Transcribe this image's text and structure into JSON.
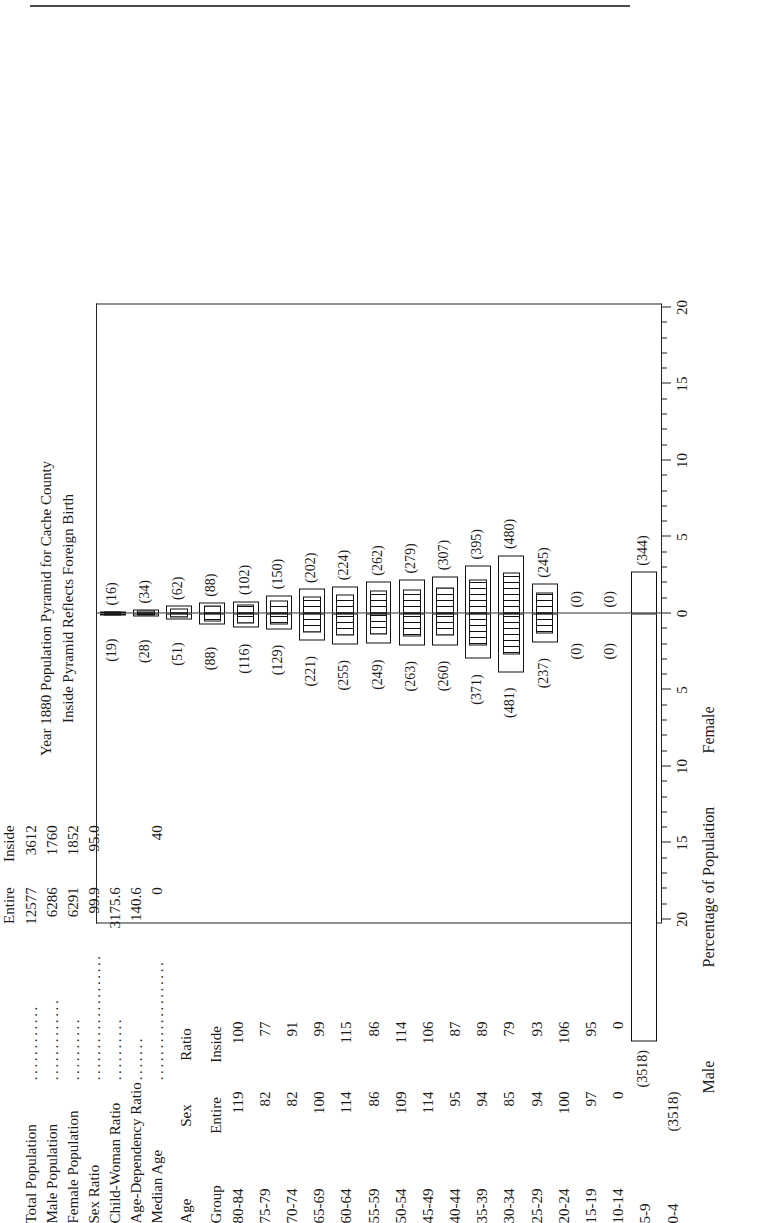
{
  "title": {
    "line1": "Year 1880 Population Pyramid for Cache County",
    "line2": "Inside Pyramid Reflects Foreign Birth"
  },
  "stats": {
    "col_headers": [
      "Entire",
      "Inside"
    ],
    "rows": [
      {
        "label": "Total Population",
        "entire": "12577",
        "inside": "3612"
      },
      {
        "label": "Male Population",
        "entire": "6286",
        "inside": "1760"
      },
      {
        "label": "Female Population",
        "entire": "6291",
        "inside": "1852"
      },
      {
        "label": "Sex Ratio",
        "entire": "99.9",
        "inside": "95.0"
      },
      {
        "label": "Child-Woman Ratio",
        "entire": "3175.6",
        "inside": ""
      },
      {
        "label": "Age-Dependency Ratio",
        "entire": "140.6",
        "inside": ""
      },
      {
        "label": "Median Age",
        "entire": "0",
        "inside": "40"
      }
    ]
  },
  "age_table": {
    "header_age": "Age",
    "header_group": "Group",
    "header_sex": "Sex",
    "header_ratio": "Ratio",
    "header_entire": "Entire",
    "header_inside": "Inside",
    "rows": [
      {
        "age": "80-84",
        "entire": "119",
        "inside": "100"
      },
      {
        "age": "75-79",
        "entire": "82",
        "inside": "77"
      },
      {
        "age": "70-74",
        "entire": "82",
        "inside": "91"
      },
      {
        "age": "65-69",
        "entire": "100",
        "inside": "99"
      },
      {
        "age": "60-64",
        "entire": "114",
        "inside": "115"
      },
      {
        "age": "55-59",
        "entire": "86",
        "inside": "86"
      },
      {
        "age": "50-54",
        "entire": "109",
        "inside": "114"
      },
      {
        "age": "45-49",
        "entire": "114",
        "inside": "106"
      },
      {
        "age": "40-44",
        "entire": "95",
        "inside": "87"
      },
      {
        "age": "35-39",
        "entire": "94",
        "inside": "89"
      },
      {
        "age": "30-34",
        "entire": "85",
        "inside": "79"
      },
      {
        "age": "25-29",
        "entire": "94",
        "inside": "93"
      },
      {
        "age": "20-24",
        "entire": "100",
        "inside": "106"
      },
      {
        "age": "15-19",
        "entire": "97",
        "inside": "95"
      },
      {
        "age": "10-14",
        "entire": "0",
        "inside": "0"
      },
      {
        "age": "5-9",
        "entire": "",
        "inside": ""
      },
      {
        "age": "0-4",
        "entire": "(3518)",
        "inside": ""
      }
    ]
  },
  "axis": {
    "xlabel": "Percentage of Population",
    "male_label": "Male",
    "female_label": "Female",
    "ticks": [
      "20",
      "15",
      "10",
      "5",
      "0",
      "5",
      "10",
      "15",
      "20"
    ],
    "xlim": [
      -20,
      20
    ]
  },
  "chart_data": {
    "type": "bar",
    "title": "Year 1880 Population Pyramid for Cache County",
    "subtitle": "Inside Pyramid Reflects Foreign Birth",
    "xlabel": "Percentage of Population",
    "ylabel": "Age Group",
    "xlim": [
      -20,
      20
    ],
    "grid": false,
    "legend": [
      "Male",
      "Female"
    ],
    "legend_position": "below-axis",
    "categories": [
      "80-84",
      "75-79",
      "70-74",
      "65-69",
      "60-64",
      "55-59",
      "50-54",
      "45-49",
      "40-44",
      "35-39",
      "30-34",
      "25-29",
      "20-24",
      "15-19",
      "10-14",
      "5-9",
      "0-4"
    ],
    "series": [
      {
        "name": "Male (Entire) counts",
        "values": [
          19,
          28,
          51,
          88,
          116,
          129,
          221,
          255,
          249,
          263,
          260,
          371,
          481,
          237,
          0,
          0,
          3518
        ]
      },
      {
        "name": "Female (Entire) counts",
        "values": [
          16,
          34,
          62,
          88,
          102,
          150,
          202,
          224,
          262,
          279,
          307,
          395,
          480,
          245,
          0,
          0,
          344
        ]
      },
      {
        "name": "Male (Inside) counts",
        "values": [
          13,
          19,
          36,
          62,
          82,
          91,
          156,
          180,
          176,
          186,
          184,
          262,
          340,
          167,
          0,
          0,
          0
        ]
      },
      {
        "name": "Female (Inside) counts",
        "values": [
          11,
          24,
          44,
          62,
          72,
          106,
          143,
          158,
          185,
          197,
          217,
          279,
          339,
          173,
          0,
          0,
          0
        ]
      }
    ],
    "male_labels": [
      "(19)",
      "(28)",
      "(51)",
      "(88)",
      "(116)",
      "(129)",
      "(221)",
      "(255)",
      "(249)",
      "(263)",
      "(260)",
      "(371)",
      "(481)",
      "(237)",
      "(0)",
      "(0)",
      "(3518)"
    ],
    "female_labels": [
      "(16)",
      "(34)",
      "(62)",
      "(88)",
      "(102)",
      "(150)",
      "(202)",
      "(224)",
      "(262)",
      "(279)",
      "(307)",
      "(395)",
      "(480)",
      "(245)",
      "(0)",
      "(0)",
      "(344)"
    ]
  }
}
